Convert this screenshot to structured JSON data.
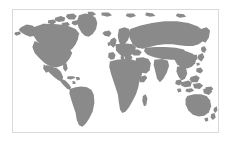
{
  "figure": {
    "type": "world-map",
    "projection": "equirectangular",
    "title": "",
    "caption": "",
    "has_labels": false,
    "has_legend": false,
    "has_graticule": false,
    "antarctica_shown": false
  },
  "colors": {
    "background": "#ffffff",
    "ocean": "#ffffff",
    "land": "#8a8a8a",
    "border": "#d9d9d9"
  },
  "frame": {
    "x": 12,
    "y": 9,
    "width": 207,
    "height": 124,
    "border_width": 1
  },
  "map_extent": {
    "lon_min": -180,
    "lon_max": 180,
    "lat_min": -58,
    "lat_max": 84
  },
  "regions": [
    {
      "name": "north-america"
    },
    {
      "name": "greenland"
    },
    {
      "name": "arctic-islands"
    },
    {
      "name": "central-america"
    },
    {
      "name": "south-america"
    },
    {
      "name": "europe"
    },
    {
      "name": "africa"
    },
    {
      "name": "madagascar"
    },
    {
      "name": "asia"
    },
    {
      "name": "japan"
    },
    {
      "name": "southeast-asia-islands"
    },
    {
      "name": "australia"
    },
    {
      "name": "new-zealand"
    },
    {
      "name": "british-isles"
    },
    {
      "name": "iceland"
    }
  ]
}
